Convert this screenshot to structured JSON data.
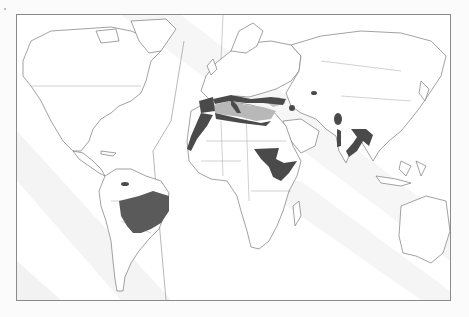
{
  "figure": {
    "type": "world-map",
    "projection": "mercator-like",
    "labels": [],
    "colors": {
      "frame": "#8a8a8a",
      "land": "#ffffff",
      "outline": "#7a7a7a",
      "region_dark": "#4a4a4a",
      "region_sea": "#b8b8b8",
      "background_streaks": "#e6e6e6"
    },
    "highlighted_regions": [
      {
        "name": "Brazil (central and north-east)",
        "shade": "dark"
      },
      {
        "name": "Northern South America spot",
        "shade": "dark"
      },
      {
        "name": "Mediterranean coastline (Iberia, Italy, Balkans, Turkey)",
        "shade": "dark"
      },
      {
        "name": "Mediterranean Sea",
        "shade": "light"
      },
      {
        "name": "Black Sea area",
        "shade": "light"
      },
      {
        "name": "North-west African coast (Morocco, Western Sahara)",
        "shade": "dark"
      },
      {
        "name": "Sudan, Ethiopia, Somalia, Kenya",
        "shade": "dark"
      },
      {
        "name": "Caspian region spot",
        "shade": "dark"
      },
      {
        "name": "Central Asia spot",
        "shade": "dark"
      },
      {
        "name": "Pakistan / Kashmir",
        "shade": "dark"
      },
      {
        "name": "Western India streak",
        "shade": "dark"
      },
      {
        "name": "Bengal / Bangladesh / eastern India",
        "shade": "dark"
      }
    ]
  }
}
